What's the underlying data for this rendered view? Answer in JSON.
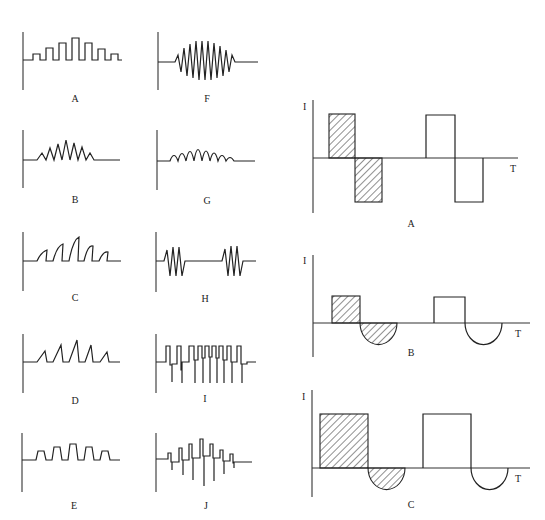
{
  "left_panels": [
    {
      "id": "A",
      "label": "A",
      "shape": "rectangular-pulse-train"
    },
    {
      "id": "B",
      "label": "B",
      "shape": "triangular-spike-train"
    },
    {
      "id": "C",
      "label": "C",
      "shape": "curved-sawtooth-spikes"
    },
    {
      "id": "D",
      "label": "D",
      "shape": "sawtooth-spikes"
    },
    {
      "id": "E",
      "label": "E",
      "shape": "trapezoid-pulse-train"
    },
    {
      "id": "F",
      "label": "F",
      "shape": "amplitude-modulated-biphasic"
    },
    {
      "id": "G",
      "label": "G",
      "shape": "rounded-pulse-train"
    },
    {
      "id": "H",
      "label": "H",
      "shape": "burst-biphasic"
    },
    {
      "id": "I",
      "label": "I",
      "shape": "square-pulse-with-negative-spikes"
    },
    {
      "id": "J",
      "label": "J",
      "shape": "modulated-pulse-with-negative-spikes"
    }
  ],
  "right_panels": [
    {
      "id": "A",
      "label": "A",
      "y_axis": "I",
      "x_axis": "T",
      "shape": "biphasic-square"
    },
    {
      "id": "B",
      "label": "B",
      "y_axis": "I",
      "x_axis": "T",
      "shape": "square-then-half-sine"
    },
    {
      "id": "C",
      "label": "C",
      "y_axis": "I",
      "x_axis": "T",
      "shape": "wide-square-then-half-sine"
    }
  ],
  "colors": {
    "stroke": "#222222",
    "background": "#ffffff"
  }
}
